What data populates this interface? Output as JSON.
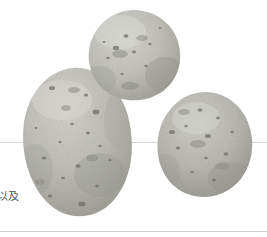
{
  "page": {
    "background_color": "#ffffff",
    "width": 267,
    "height": 237
  },
  "caption": {
    "text": "以及",
    "color": "#5d5d5d"
  },
  "rules": {
    "middle_label": "horizontal-rule-middle",
    "bottom_label": "horizontal-rule-bottom",
    "color": "#d6d6d6"
  },
  "photo": {
    "label": "potato-photograph",
    "subject": "three potatoes",
    "palette": {
      "skin_light": "#d2d1cc",
      "skin_mid": "#bdbcb6",
      "skin_dark": "#a3a29c",
      "shadow": "#8d8c86",
      "speckle": "#6e6d67"
    },
    "items": [
      {
        "name": "potato-top",
        "shape": "round",
        "cx": 133,
        "cy": 57
      },
      {
        "name": "potato-left-large",
        "shape": "elongated-oval",
        "cx": 75,
        "cy": 145
      },
      {
        "name": "potato-right",
        "shape": "oval",
        "cx": 205,
        "cy": 147
      }
    ]
  }
}
